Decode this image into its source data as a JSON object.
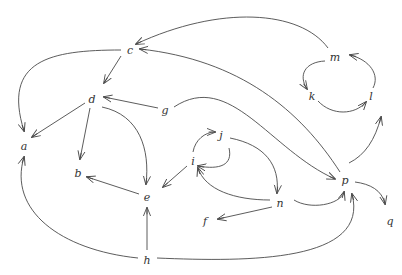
{
  "diagram": {
    "type": "directed-graph",
    "colors": {
      "edge": "#4a4a4a",
      "label": "#333333",
      "background": "#ffffff"
    },
    "nodes": [
      {
        "id": "a",
        "label": "a",
        "x": 24,
        "y": 146
      },
      {
        "id": "b",
        "label": "b",
        "x": 78,
        "y": 173
      },
      {
        "id": "c",
        "label": "c",
        "x": 130,
        "y": 50
      },
      {
        "id": "d",
        "label": "d",
        "x": 92,
        "y": 99
      },
      {
        "id": "e",
        "label": "e",
        "x": 147,
        "y": 197
      },
      {
        "id": "f",
        "label": "f",
        "x": 205,
        "y": 221
      },
      {
        "id": "g",
        "label": "g",
        "x": 165,
        "y": 110
      },
      {
        "id": "h",
        "label": "h",
        "x": 147,
        "y": 260
      },
      {
        "id": "i",
        "label": "i",
        "x": 193,
        "y": 161
      },
      {
        "id": "j",
        "label": "j",
        "x": 221,
        "y": 135
      },
      {
        "id": "k",
        "label": "k",
        "x": 312,
        "y": 96
      },
      {
        "id": "l",
        "label": "l",
        "x": 371,
        "y": 96
      },
      {
        "id": "m",
        "label": "m",
        "x": 335,
        "y": 57
      },
      {
        "id": "n",
        "label": "n",
        "x": 280,
        "y": 203
      },
      {
        "id": "p",
        "label": "p",
        "x": 345,
        "y": 180
      },
      {
        "id": "q",
        "label": "q",
        "x": 390,
        "y": 221
      }
    ],
    "edges": [
      {
        "from": "m",
        "to": "c",
        "path": "M 328 48 C 300 10, 220 5, 136 44"
      },
      {
        "from": "p",
        "to": "c",
        "path": "M 340 172 C 300 110, 240 60, 140 49"
      },
      {
        "from": "c",
        "to": "d",
        "path": "M 121 56 L 104 83"
      },
      {
        "from": "c",
        "to": "a",
        "path": "M 121 50 C 50 50, 2 60, 24 131"
      },
      {
        "from": "d",
        "to": "a",
        "path": "M 85 103 L 32 137"
      },
      {
        "from": "d",
        "to": "b",
        "path": "M 90 108 L 80 159"
      },
      {
        "from": "d",
        "to": "e",
        "path": "M 102 107 C 140 115, 150 150, 146 184"
      },
      {
        "from": "g",
        "to": "d",
        "path": "M 158 108 L 104 97"
      },
      {
        "from": "g",
        "to": "p",
        "path": "M 174 107 C 230 70, 270 150, 335 179"
      },
      {
        "from": "e",
        "to": "b",
        "path": "M 139 194 L 87 177"
      },
      {
        "from": "h",
        "to": "e",
        "path": "M 147 250 L 147 208"
      },
      {
        "from": "h",
        "to": "a",
        "path": "M 138 258 C 60 250, 8 210, 24 157"
      },
      {
        "from": "h",
        "to": "p",
        "path": "M 157 258 C 250 262, 370 262, 352 194"
      },
      {
        "from": "i",
        "to": "e",
        "path": "M 187 166 L 163 187"
      },
      {
        "from": "i",
        "to": "j",
        "path": "M 193 152 C 195 140, 205 132, 215 132"
      },
      {
        "from": "j",
        "to": "i",
        "path": "M 229 148 C 233 165, 220 170, 198 166"
      },
      {
        "from": "j",
        "to": "n",
        "path": "M 230 138 C 265 145, 280 165, 277 193"
      },
      {
        "from": "n",
        "to": "i",
        "path": "M 270 200 C 235 200, 205 190, 198 168"
      },
      {
        "from": "n",
        "to": "f",
        "path": "M 272 207 L 218 219"
      },
      {
        "from": "n",
        "to": "p",
        "path": "M 294 200 C 310 210, 340 205, 344 192"
      },
      {
        "from": "p",
        "to": "q",
        "path": "M 355 182 C 370 184, 382 190, 385 204"
      },
      {
        "from": "p",
        "to": "l",
        "path": "M 349 163 C 365 155, 375 140, 381 117"
      },
      {
        "from": "m",
        "to": "k",
        "path": "M 325 61 C 305 62, 298 75, 307 89"
      },
      {
        "from": "k",
        "to": "l",
        "path": "M 318 101 C 332 116, 355 115, 366 102"
      },
      {
        "from": "l",
        "to": "m",
        "path": "M 373 88 C 380 75, 370 60, 350 55"
      }
    ]
  }
}
